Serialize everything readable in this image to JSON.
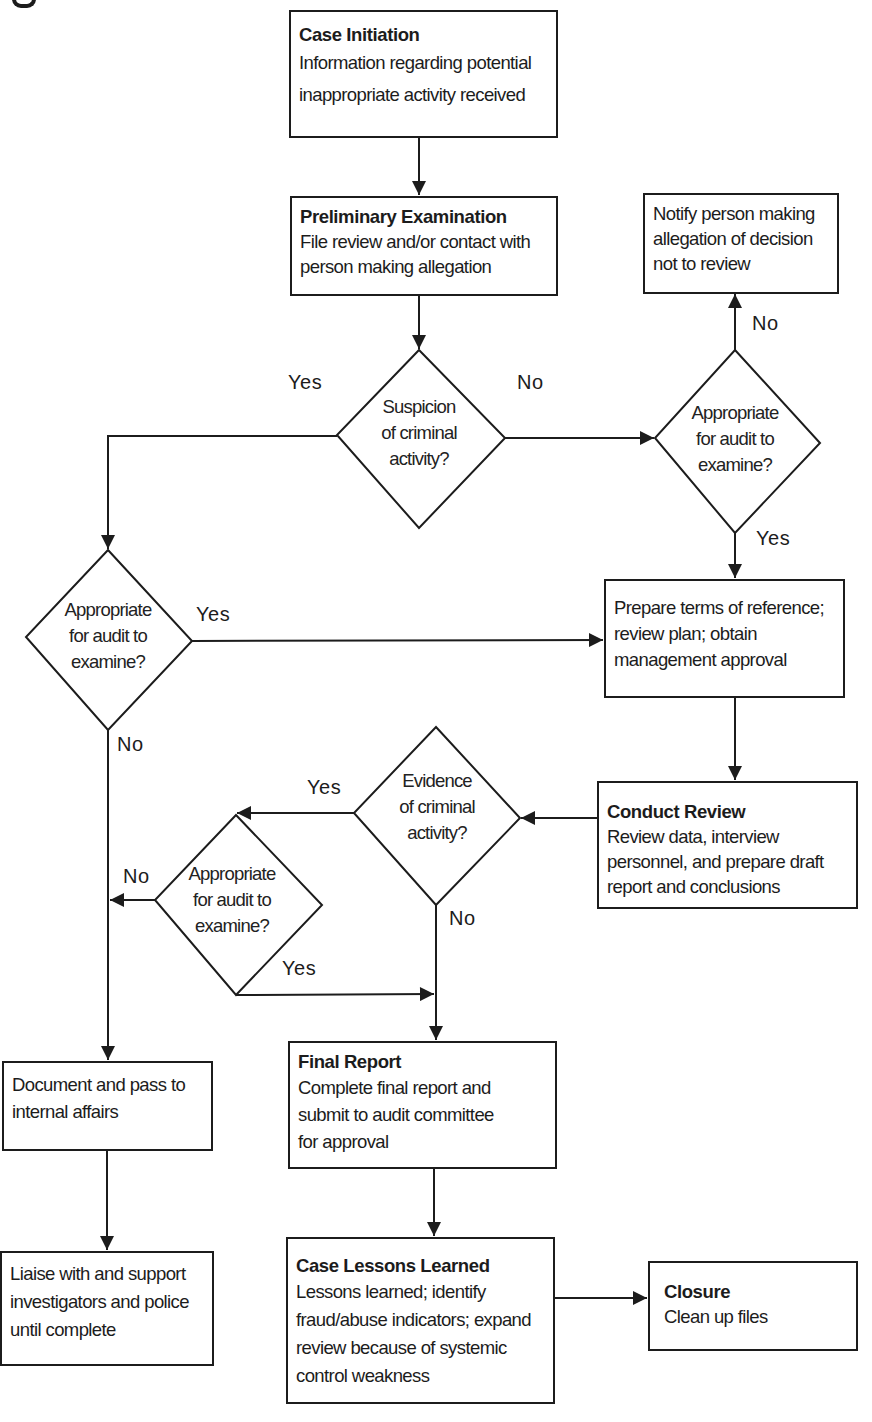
{
  "figure": {
    "cropped_caption_glyph": "g"
  },
  "nodes": {
    "case_initiation": {
      "title": "Case Initiation",
      "body": "Information regarding potential\ninappropriate activity received"
    },
    "preliminary_examination": {
      "title": "Preliminary Examination",
      "body": "File review and/or contact with\nperson making allegation"
    },
    "notify_person": {
      "body": "Notify person making\nallegation of decision\nnot to review"
    },
    "suspicion_decision": {
      "text": "Suspicion\nof criminal\nactivity?"
    },
    "appropriate_audit_right": {
      "text": "Appropriate\nfor audit to\nexamine?"
    },
    "appropriate_audit_left": {
      "text": "Appropriate\nfor audit to\nexamine?"
    },
    "prepare_terms": {
      "body": "Prepare terms of reference;\nreview plan; obtain\nmanagement approval"
    },
    "conduct_review": {
      "title": "Conduct Review",
      "body": "Review data, interview\npersonnel, and prepare draft\nreport and conclusions"
    },
    "evidence_decision": {
      "text": "Evidence\nof criminal\nactivity?"
    },
    "appropriate_audit_middle": {
      "text": "Appropriate\nfor audit to\nexamine?"
    },
    "document_pass": {
      "body": "Document and pass to\ninternal affairs"
    },
    "final_report": {
      "title": "Final Report",
      "body": "Complete final report and\nsubmit to audit committee\n for approval"
    },
    "liaise_support": {
      "body": "Liaise with and support\ninvestigators and police\nuntil complete"
    },
    "lessons_learned": {
      "title": "Case Lessons Learned",
      "body": "Lessons learned; identify\nfraud/abuse indicators; expand\nreview because of systemic\ncontrol weakness"
    },
    "closure": {
      "title": "Closure",
      "body": "Clean up files"
    }
  },
  "edge_labels": {
    "suspicion_yes": "Yes",
    "suspicion_no": "No",
    "right_audit_no": "No",
    "right_audit_yes": "Yes",
    "left_audit_yes": "Yes",
    "left_audit_no": "No",
    "evidence_yes": "Yes",
    "evidence_no": "No",
    "middle_audit_no": "No",
    "middle_audit_yes": "Yes"
  },
  "colors": {
    "stroke": "#1c1c1c",
    "background": "#ffffff"
  }
}
